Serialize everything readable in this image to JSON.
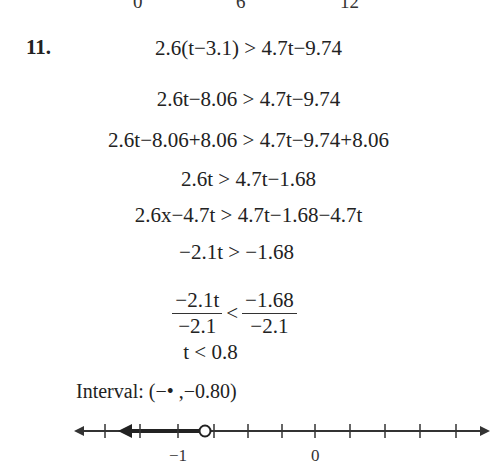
{
  "top_axis_labels": [
    {
      "text": "0",
      "x": 139
    },
    {
      "text": "6",
      "x": 241
    },
    {
      "text": "12",
      "x": 349
    }
  ],
  "problem": {
    "number": "11.",
    "steps": [
      {
        "lhs": "2.6(t−3.1)",
        "op": ">",
        "rhs": "4.7t−9.74"
      },
      {
        "lhs": "2.6t−8.06",
        "op": ">",
        "rhs": "4.7t−9.74"
      },
      {
        "lhs": "2.6t−8.06+8.06",
        "op": ">",
        "rhs": "4.7t−9.74+8.06"
      },
      {
        "lhs": "2.6t",
        "op": ">",
        "rhs": "4.7t−1.68"
      },
      {
        "lhs": "2.6x−4.7t",
        "op": ">",
        "rhs": "4.7t−1.68−4.7t"
      },
      {
        "lhs": "−2.1t",
        "op": ">",
        "rhs": "−1.68"
      }
    ],
    "fraction_step": {
      "left_num": "−2.1t",
      "left_den": "−2.1",
      "op": "<",
      "right_num": "−1.68",
      "right_den": "−2.1"
    },
    "result": "t < 0.8",
    "interval_label": "Interval:",
    "interval_value": "(−• ,−0.80)"
  },
  "number_line": {
    "labels": [
      {
        "text": "−1",
        "value": -1
      },
      {
        "text": "0",
        "value": 0
      }
    ],
    "tick_step": 0.25,
    "open_circle_at": -0.8,
    "shaded": "left",
    "line_color": "#333333"
  }
}
